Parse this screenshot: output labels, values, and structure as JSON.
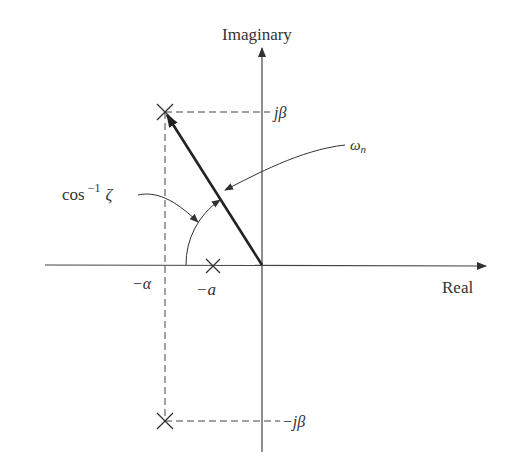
{
  "diagram": {
    "type": "s-plane pole-zero diagram",
    "axes": {
      "vertical_label": "Imaginary",
      "horizontal_label": "Real"
    },
    "labels": {
      "j_beta_top": "jβ",
      "j_beta_bottom": "−jβ",
      "minus_alpha": "−α",
      "minus_a": "−a",
      "omega_n": "ω",
      "omega_n_sub": "n",
      "cos_inv_zeta_base": "cos",
      "cos_inv_zeta_sup": "−1",
      "cos_inv_zeta_var": "ζ"
    },
    "poles": [
      {
        "label": "upper pole",
        "real": "−α",
        "imag": "jβ"
      },
      {
        "label": "lower pole",
        "real": "−α",
        "imag": "−jβ"
      }
    ],
    "zeros": [
      {
        "label": "zero",
        "real": "−a",
        "imag": "0"
      }
    ],
    "colors": {
      "line": "#333333",
      "vector": "#222222",
      "background": "#ffffff"
    }
  }
}
